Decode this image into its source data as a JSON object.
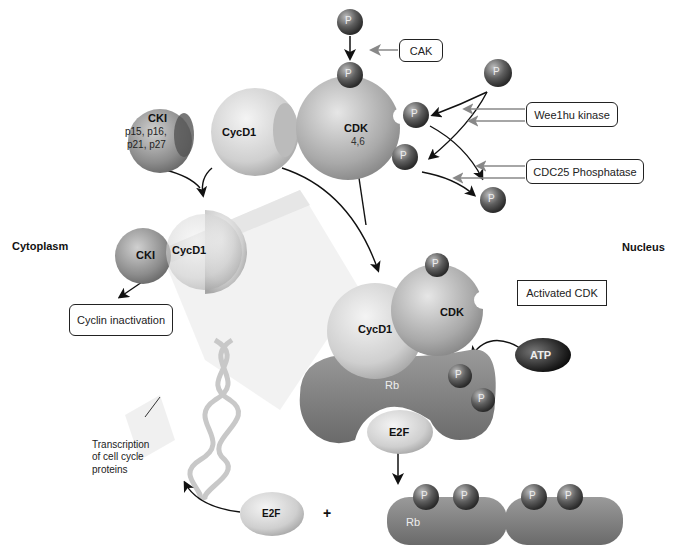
{
  "regions": {
    "cytoplasm": "Cytoplasm",
    "nucleus": "Nucleus"
  },
  "boxes": {
    "cak": "CAK",
    "wee1": "Wee1hu kinase",
    "cdc25": "CDC25 Phosphatase",
    "activated_cdk": "Activated CDK",
    "cyclin_inactivation": "Cyclin inactivation"
  },
  "molecules": {
    "cki_top": {
      "name": "CKI",
      "sub1": "p15, p16,",
      "sub2": "p21, p27"
    },
    "cycd1_top": "CycD1",
    "cdk_top": {
      "name": "CDK",
      "sub": "4,6"
    },
    "cki_complex": "CKI",
    "cycd1_complex": "CycD1",
    "cycd1_active": "CycD1",
    "cdk_active": "CDK",
    "atp": "ATP",
    "rb": "Rb",
    "e2f_bound": "E2F",
    "e2f_free": "E2F",
    "rb_free": "Rb",
    "phosphate": "P",
    "plus": "+"
  },
  "annotations": {
    "transcription": [
      "Transcription",
      "of cell cycle",
      "proteins"
    ]
  },
  "colors": {
    "sphere_dark": "#5a5a5a",
    "sphere_light": "#d8d8d8",
    "arrow": "#111111",
    "arrow_gray": "#888888"
  }
}
